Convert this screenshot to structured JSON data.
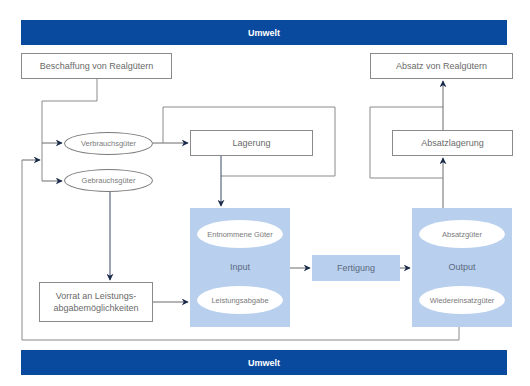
{
  "bands": {
    "top": "Umwelt",
    "bottom": "Umwelt"
  },
  "boxes": {
    "beschaffung": "Beschaffung von Realgütern",
    "absatz": "Absatz von Realgütern",
    "lagerung": "Lagerung",
    "absatzlagerung": "Absatzlagerung",
    "vorrat": "Vorrat an Leistungs-\nabgabemöglichkeiten",
    "fertigung": "Fertigung"
  },
  "ellipses": {
    "verbrauchsgueter": "Verbrauchsgüter",
    "gebrauchsgueter": "Gebrauchsgüter"
  },
  "input": {
    "label": "Input",
    "items": [
      "Entnommene Güter",
      "Leistungsabgabe"
    ]
  },
  "output": {
    "label": "Output",
    "items": [
      "Absatzgüter",
      "Wiedereinsatzgüter"
    ]
  },
  "colors": {
    "band": "#0a4a9e",
    "process_fill": "#b8cfee",
    "arrow": "#1a2a4a",
    "line": "#8a8a8a"
  }
}
